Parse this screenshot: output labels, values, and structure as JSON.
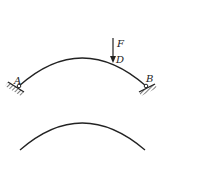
{
  "diagram": {
    "type": "arch-structure",
    "top_arch": {
      "labels": {
        "support_left": "A",
        "support_right": "B",
        "force": "F",
        "load_point": "D"
      },
      "supports": [
        "fixed-hinge",
        "fixed-hinge"
      ]
    },
    "bottom_arch": {
      "labels": {}
    },
    "colors": {
      "stroke": "#222222",
      "background": "#ffffff"
    }
  }
}
